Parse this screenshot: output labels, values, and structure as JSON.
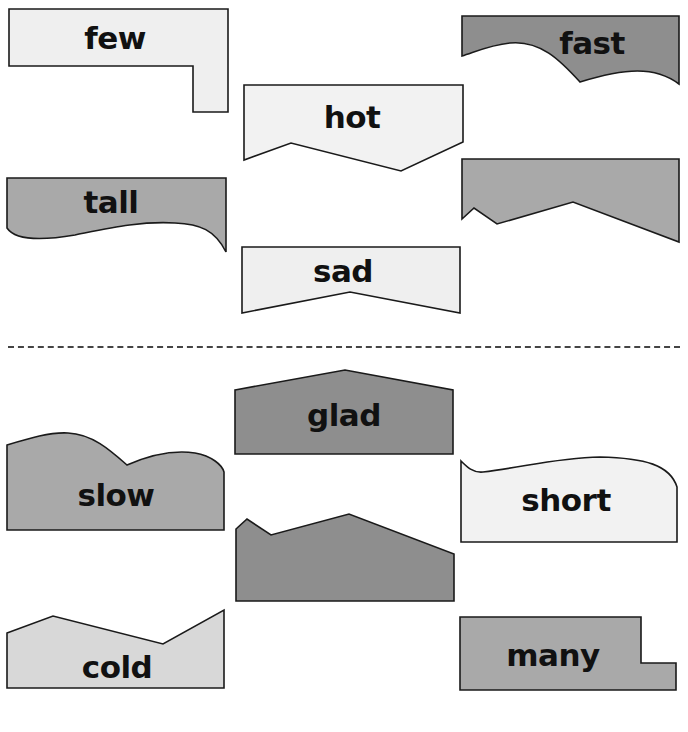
{
  "worksheet": {
    "top_section": {
      "pieces": [
        {
          "word": "few",
          "fill": "#efefef"
        },
        {
          "word": "fast",
          "fill": "#8e8e8e"
        },
        {
          "word": "hot",
          "fill": "#f2f2f2"
        },
        {
          "word": "",
          "fill": "#a9a9a9"
        },
        {
          "word": "tall",
          "fill": "#a9a9a9"
        },
        {
          "word": "sad",
          "fill": "#efefef"
        }
      ]
    },
    "bottom_section": {
      "pieces": [
        {
          "word": "glad",
          "fill": "#8e8e8e"
        },
        {
          "word": "slow",
          "fill": "#a9a9a9"
        },
        {
          "word": "short",
          "fill": "#f2f2f2"
        },
        {
          "word": "",
          "fill": "#8e8e8e"
        },
        {
          "word": "cold",
          "fill": "#d8d8d8"
        },
        {
          "word": "many",
          "fill": "#a9a9a9"
        }
      ]
    },
    "divider_color": "#444444",
    "stroke_color": "#1a1a1a"
  }
}
